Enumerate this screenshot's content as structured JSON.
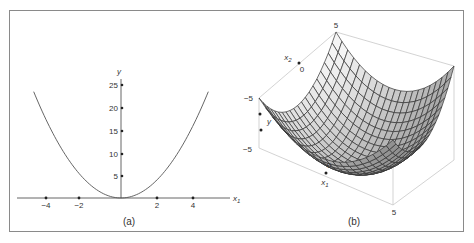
{
  "figure": {
    "panels": [
      {
        "id": "a",
        "caption": "(a)"
      },
      {
        "id": "b",
        "caption": "(b)"
      }
    ]
  },
  "chart_data": [
    {
      "type": "line",
      "panel": "(a)",
      "title": "",
      "function": "y = x1^2",
      "xlabel": "x1",
      "ylabel": "y",
      "x_ticks": [
        -4,
        -2,
        2,
        4
      ],
      "x_tick_labels": [
        "−4",
        "−2",
        "2",
        "4"
      ],
      "y_ticks": [
        5,
        10,
        15,
        20,
        25
      ],
      "y_tick_labels": [
        "5",
        "10",
        "15",
        "20",
        "25"
      ],
      "xlim": [
        -5.2,
        5.2
      ],
      "ylim": [
        0,
        27
      ],
      "grid": false,
      "series": [
        {
          "name": "y = x1^2",
          "x": [
            -5,
            -4,
            -3,
            -2,
            -1,
            0,
            1,
            2,
            3,
            4,
            5
          ],
          "y": [
            25,
            16,
            9,
            4,
            1,
            0,
            1,
            4,
            9,
            16,
            25
          ]
        }
      ]
    },
    {
      "type": "surface",
      "panel": "(b)",
      "title": "",
      "function": "y = x1^2 + x2^2",
      "xlabel": "x1",
      "zlabel": "x2",
      "ylabel": "y",
      "x1_range": [
        -5,
        5
      ],
      "x2_range": [
        -5,
        5
      ],
      "tick_labels": {
        "top": "5",
        "x2_mid": "0",
        "left_upper": "−5",
        "left_lower": "−5",
        "x1_mid": "0",
        "bottom": "5"
      },
      "grid_lines_per_axis": 20
    }
  ],
  "labels": {
    "a": {
      "y_axis": "y",
      "x_axis": "x",
      "x_axis_sub": "1",
      "xt": [
        "−4",
        "−2",
        "2",
        "4"
      ],
      "yt": [
        "5",
        "10",
        "15",
        "20",
        "25"
      ]
    },
    "b": {
      "top5": "5",
      "x2": "x",
      "x2_sub": "2",
      "x2_zero": "0",
      "left_m5": "−5",
      "y": "y",
      "lower_m5": "−5",
      "x1_zero": "0",
      "x1": "x",
      "x1_sub": "1",
      "bottom5": "5"
    }
  },
  "colors": {
    "frame": "#8a8a8a",
    "axis": "#555555",
    "curve": "#555555",
    "mesh": "#333333",
    "box": "#c8c8c8"
  }
}
